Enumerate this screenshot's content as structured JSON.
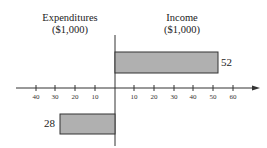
{
  "chart_data": {
    "type": "bar",
    "orientation": "horizontal",
    "categories": [
      "Income",
      "Expenditures"
    ],
    "values": [
      52,
      -28
    ],
    "data_labels": [
      "52",
      "28"
    ],
    "left_label": {
      "line1": "Expenditures",
      "line2": "($1,000)"
    },
    "right_label": {
      "line1": "Income",
      "line2": "($1,000)"
    },
    "xticks_left": [
      "40",
      "30",
      "20",
      "10"
    ],
    "xticks_right": [
      "10",
      "20",
      "30",
      "40",
      "50",
      "60"
    ],
    "xlim": [
      -45,
      70
    ],
    "bar_color": "#b0b0b0",
    "grid": false
  }
}
